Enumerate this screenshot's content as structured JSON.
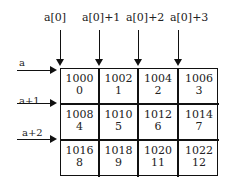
{
  "column_pointers": [
    "a[0]",
    "a[0]+1",
    "a[0]+2",
    "a[0]+3"
  ],
  "row_pointers": [
    "a",
    "a+1",
    "a+2"
  ],
  "cells": [
    [
      {
        "address": "1000",
        "value": "0"
      },
      {
        "address": "1002",
        "value": "1"
      },
      {
        "address": "1004",
        "value": "2"
      },
      {
        "address": "1006",
        "value": "3"
      }
    ],
    [
      {
        "address": "1008",
        "value": "4"
      },
      {
        "address": "1010",
        "value": "5"
      },
      {
        "address": "1012",
        "value": "6"
      },
      {
        "address": "1014",
        "value": "7"
      }
    ],
    [
      {
        "address": "1016",
        "value": "8"
      },
      {
        "address": "1018",
        "value": "9"
      },
      {
        "address": "1020",
        "value": "11"
      },
      {
        "address": "1022",
        "value": "12"
      }
    ]
  ]
}
